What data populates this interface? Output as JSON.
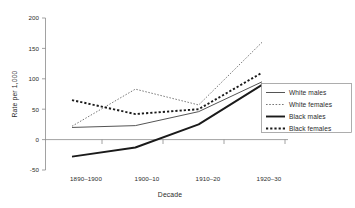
{
  "chart_data": {
    "type": "line",
    "title": "",
    "xlabel": "Decade",
    "ylabel": "Rate per 1,000",
    "categories": [
      "1890–1900",
      "1900–10",
      "1910–20",
      "1920–30"
    ],
    "ylim": [
      -50,
      200
    ],
    "yticks": [
      -50,
      0,
      50,
      100,
      150,
      200
    ],
    "ytick_labels": [
      "-50",
      "0",
      "50",
      "100",
      "150",
      "200"
    ],
    "grid": false,
    "legend_position": "right",
    "series": [
      {
        "name": "White males",
        "values": [
          20,
          23,
          46,
          95
        ],
        "style": "solid",
        "width": "thin",
        "color": "#555555"
      },
      {
        "name": "White females",
        "values": [
          22,
          83,
          57,
          160
        ],
        "style": "dotted",
        "width": "thin",
        "color": "#777777"
      },
      {
        "name": "Black males",
        "values": [
          -28,
          -13,
          25,
          90
        ],
        "style": "solid",
        "width": "thick",
        "color": "#1a1a1a"
      },
      {
        "name": "Black females",
        "values": [
          65,
          42,
          50,
          110
        ],
        "style": "dashed",
        "width": "thick",
        "color": "#1a1a1a"
      }
    ]
  },
  "axes": {
    "y_title": "Rate per 1,000",
    "x_title": "Decade",
    "y_tick_200": "200",
    "y_tick_150": "150",
    "y_tick_100": "100",
    "y_tick_50": "50",
    "y_tick_0": "0",
    "y_tick_neg50": "-50",
    "x_tick_1": "1890–1900",
    "x_tick_2": "1900–10",
    "x_tick_3": "1910–20",
    "x_tick_4": "1920–30"
  },
  "legend": {
    "entries": [
      {
        "label": "White males"
      },
      {
        "label": "White females"
      },
      {
        "label": "Black males"
      },
      {
        "label": "Black females"
      }
    ]
  }
}
